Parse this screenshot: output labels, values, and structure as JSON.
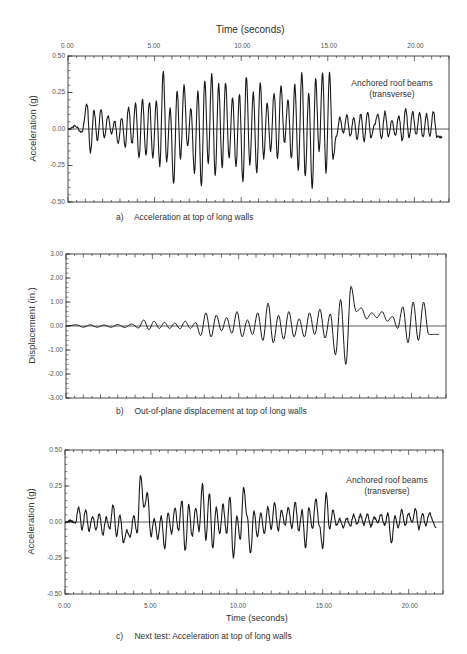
{
  "figure": {
    "top_axis_title": "Time (seconds)",
    "bottom_axis_title": "Time (seconds)"
  },
  "chart_data": [
    {
      "id": "a",
      "type": "line",
      "title": "",
      "caption_letter": "a)",
      "caption": "Acceleration at top of long walls",
      "xlabel": "Time (seconds)",
      "xlabel_position": "top",
      "ylabel": "Acceleration (g)",
      "xlim": [
        0,
        22
      ],
      "ylim": [
        -0.5,
        0.5
      ],
      "x_ticks": [
        "0.00",
        "5.00",
        "10.00",
        "15.00",
        "20.00"
      ],
      "y_ticks": [
        "0.50",
        "0.25",
        "0.00",
        "-0.25",
        "-0.50"
      ],
      "grid": false,
      "annotation": [
        "Anchored roof beams",
        "(transverse)"
      ],
      "series": [
        {
          "name": "Acceleration",
          "x": [
            0.0,
            0.4,
            0.8,
            1.1,
            1.3,
            1.5,
            1.7,
            1.9,
            2.1,
            2.3,
            2.5,
            2.7,
            2.9,
            3.1,
            3.3,
            3.5,
            3.7,
            3.9,
            4.1,
            4.3,
            4.5,
            4.7,
            4.9,
            5.1,
            5.3,
            5.5,
            5.7,
            5.9,
            6.1,
            6.3,
            6.5,
            6.7,
            6.9,
            7.1,
            7.3,
            7.5,
            7.7,
            7.9,
            8.1,
            8.3,
            8.5,
            8.7,
            8.9,
            9.1,
            9.3,
            9.5,
            9.7,
            9.9,
            10.1,
            10.3,
            10.5,
            10.7,
            10.9,
            11.1,
            11.3,
            11.5,
            11.7,
            11.9,
            12.1,
            12.3,
            12.5,
            12.7,
            12.9,
            13.1,
            13.3,
            13.5,
            13.7,
            13.9,
            14.1,
            14.3,
            14.5,
            14.7,
            14.9,
            15.1,
            15.3,
            15.5,
            15.7,
            15.9,
            16.1,
            16.3,
            16.5,
            16.7,
            16.9,
            17.1,
            17.3,
            17.5,
            17.7,
            17.9,
            18.1,
            18.3,
            18.5,
            18.7,
            18.9,
            19.1,
            19.3,
            19.5,
            19.7,
            19.9,
            20.1,
            20.3,
            20.5,
            20.7,
            20.9,
            21.1,
            21.3,
            21.6
          ],
          "values": [
            0.0,
            0.02,
            -0.02,
            0.17,
            -0.16,
            0.13,
            -0.08,
            0.14,
            -0.06,
            0.09,
            -0.03,
            0.05,
            -0.1,
            0.08,
            -0.12,
            0.15,
            -0.1,
            0.18,
            -0.2,
            0.21,
            -0.18,
            0.18,
            -0.2,
            0.19,
            -0.25,
            0.4,
            -0.22,
            0.14,
            -0.37,
            0.26,
            -0.2,
            0.3,
            -0.12,
            0.14,
            -0.3,
            0.26,
            -0.39,
            0.33,
            -0.23,
            0.38,
            -0.32,
            0.31,
            -0.26,
            0.32,
            -0.2,
            0.22,
            -0.25,
            0.24,
            -0.36,
            0.36,
            -0.24,
            0.25,
            -0.3,
            0.32,
            -0.2,
            0.18,
            -0.15,
            0.25,
            -0.2,
            0.3,
            -0.1,
            0.2,
            -0.2,
            0.3,
            -0.28,
            0.38,
            -0.32,
            0.25,
            -0.4,
            0.34,
            -0.15,
            0.38,
            -0.3,
            0.38,
            -0.2,
            -0.05,
            0.08,
            -0.03,
            0.1,
            -0.05,
            0.08,
            -0.07,
            0.1,
            -0.08,
            0.12,
            -0.06,
            0.03,
            0.1,
            -0.07,
            0.12,
            -0.05,
            0.06,
            -0.04,
            0.09,
            -0.08,
            0.14,
            -0.06,
            0.12,
            -0.04,
            0.11,
            -0.06,
            0.1,
            -0.05,
            0.12,
            -0.05,
            -0.06
          ]
        }
      ]
    },
    {
      "id": "b",
      "type": "line",
      "title": "",
      "caption_letter": "b)",
      "caption": "Out-of-plane displacement at top of long walls",
      "xlabel": "",
      "ylabel": "Displacement (in.)",
      "xlim": [
        0,
        22
      ],
      "ylim": [
        -3,
        3
      ],
      "x_ticks": [],
      "y_ticks": [
        "3.00",
        "2.00",
        "1.00",
        "0.00",
        "-1.00",
        "-2.00",
        "-3.00"
      ],
      "grid": false,
      "series": [
        {
          "name": "Displacement",
          "x": [
            0.0,
            0.6,
            1.0,
            1.4,
            1.8,
            2.2,
            2.6,
            3.0,
            3.4,
            3.8,
            4.2,
            4.5,
            4.8,
            5.1,
            5.4,
            5.7,
            6.0,
            6.3,
            6.6,
            6.9,
            7.2,
            7.5,
            7.8,
            8.1,
            8.4,
            8.7,
            9.0,
            9.3,
            9.6,
            9.9,
            10.2,
            10.5,
            10.8,
            11.1,
            11.4,
            11.7,
            12.0,
            12.3,
            12.6,
            12.9,
            13.2,
            13.5,
            13.8,
            14.1,
            14.4,
            14.7,
            15.0,
            15.3,
            15.6,
            15.9,
            16.2,
            16.5,
            16.8,
            17.1,
            17.4,
            17.7,
            18.0,
            18.3,
            18.6,
            18.9,
            19.2,
            19.5,
            19.8,
            20.1,
            20.4,
            20.7,
            21.0,
            21.3,
            21.6
          ],
          "values": [
            0.0,
            0.05,
            -0.05,
            0.05,
            -0.05,
            0.04,
            -0.05,
            0.06,
            -0.06,
            0.08,
            -0.08,
            0.25,
            -0.15,
            0.2,
            -0.1,
            0.15,
            -0.1,
            0.12,
            -0.12,
            0.2,
            -0.1,
            0.15,
            -0.4,
            0.55,
            -0.45,
            0.45,
            -0.2,
            0.35,
            -0.3,
            0.6,
            -0.45,
            0.25,
            -0.35,
            0.55,
            -0.6,
            0.95,
            -0.7,
            0.45,
            -0.55,
            0.6,
            -0.45,
            0.3,
            -0.45,
            0.55,
            -0.35,
            0.7,
            -0.5,
            0.5,
            -1.2,
            1.1,
            -1.6,
            1.65,
            0.6,
            0.75,
            0.3,
            0.55,
            0.35,
            0.6,
            0.2,
            0.4,
            -0.1,
            0.8,
            -0.7,
            1.0,
            -0.6,
            1.0,
            -0.35,
            -0.35,
            -0.35
          ]
        }
      ]
    },
    {
      "id": "c",
      "type": "line",
      "title": "",
      "caption_letter": "c)",
      "caption": "Next test: Acceleration at top of long walls",
      "xlabel": "Time (seconds)",
      "xlabel_position": "bottom",
      "ylabel": "Acceleration (g)",
      "xlim": [
        0,
        22
      ],
      "ylim": [
        -0.5,
        0.5
      ],
      "x_ticks": [
        "0.00",
        "5.00",
        "10.00",
        "15.00",
        "20.00"
      ],
      "y_ticks": [
        "0.50",
        "0.25",
        "0.00",
        "-0.25",
        "-0.50"
      ],
      "grid": false,
      "annotation": [
        "Anchored roof beams",
        "(transverse)"
      ],
      "series": [
        {
          "name": "Acceleration",
          "x": [
            0.0,
            0.3,
            0.6,
            0.8,
            1.0,
            1.2,
            1.4,
            1.6,
            1.8,
            2.0,
            2.2,
            2.4,
            2.6,
            2.8,
            3.0,
            3.2,
            3.4,
            3.6,
            3.8,
            4.0,
            4.2,
            4.4,
            4.6,
            4.8,
            5.0,
            5.2,
            5.4,
            5.6,
            5.8,
            6.0,
            6.2,
            6.4,
            6.6,
            6.8,
            7.0,
            7.2,
            7.4,
            7.6,
            7.8,
            8.0,
            8.2,
            8.4,
            8.6,
            8.8,
            9.0,
            9.2,
            9.4,
            9.6,
            9.8,
            10.0,
            10.2,
            10.4,
            10.6,
            10.8,
            11.0,
            11.2,
            11.4,
            11.6,
            11.8,
            12.0,
            12.2,
            12.4,
            12.6,
            12.8,
            13.0,
            13.2,
            13.4,
            13.6,
            13.8,
            14.0,
            14.2,
            14.4,
            14.6,
            14.8,
            15.0,
            15.2,
            15.4,
            15.6,
            15.8,
            16.0,
            16.2,
            16.4,
            16.6,
            16.8,
            17.0,
            17.2,
            17.4,
            17.6,
            17.8,
            18.0,
            18.2,
            18.4,
            18.6,
            18.8,
            19.0,
            19.2,
            19.4,
            19.6,
            19.8,
            20.0,
            20.2,
            20.4,
            20.6,
            20.8,
            21.0,
            21.2,
            21.6
          ],
          "values": [
            0.0,
            0.01,
            -0.01,
            0.1,
            -0.05,
            0.08,
            -0.06,
            0.04,
            -0.05,
            0.06,
            -0.09,
            0.03,
            -0.05,
            0.12,
            -0.1,
            0.05,
            -0.14,
            -0.06,
            -0.1,
            0.04,
            -0.08,
            0.33,
            0.1,
            0.2,
            -0.1,
            0.02,
            -0.12,
            0.04,
            -0.18,
            0.06,
            -0.08,
            0.1,
            -0.06,
            0.15,
            -0.2,
            0.12,
            -0.1,
            0.1,
            -0.06,
            0.26,
            -0.12,
            0.2,
            -0.18,
            0.1,
            -0.08,
            0.12,
            -0.08,
            0.18,
            -0.25,
            0.04,
            -0.12,
            0.24,
            0.04,
            -0.22,
            0.08,
            -0.1,
            0.06,
            -0.08,
            0.1,
            -0.05,
            0.14,
            -0.06,
            0.08,
            -0.02,
            0.1,
            -0.04,
            0.14,
            -0.06,
            0.08,
            -0.18,
            0.1,
            -0.05,
            0.16,
            -0.02,
            -0.18,
            0.2,
            -0.05,
            0.08,
            -0.02,
            0.02,
            -0.04,
            0.03,
            -0.03,
            0.05,
            -0.02,
            0.05,
            -0.02,
            0.06,
            -0.03,
            0.03,
            0.0,
            0.05,
            -0.02,
            0.06,
            -0.15,
            0.04,
            -0.04,
            0.08,
            -0.02,
            0.06,
            0.0,
            0.09,
            -0.05,
            0.06,
            -0.02,
            0.06,
            -0.04
          ]
        }
      ]
    }
  ],
  "plots": {
    "a": {
      "caption_letter": "a)",
      "caption": "Acceleration at top of long walls",
      "ylabel": "Acceleration (g)",
      "annot1": "Anchored roof beams",
      "annot2": "(transverse)"
    },
    "b": {
      "caption_letter": "b)",
      "caption": "Out-of-plane displacement at top of long walls",
      "ylabel": "Displacement (in.)"
    },
    "c": {
      "caption_letter": "c)",
      "caption": "Next test: Acceleration at top of long walls",
      "ylabel": "Acceleration (g)",
      "annot1": "Anchored roof beams",
      "annot2": "(transverse)"
    }
  },
  "colors": {
    "line": "#1a1a1a",
    "axis": "#333333",
    "text": "#333333"
  }
}
